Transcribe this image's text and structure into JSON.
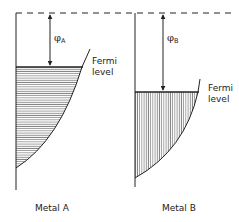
{
  "diagram": {
    "vacuum_level": {
      "style": "dashed"
    },
    "metals": [
      {
        "name": "Metal A",
        "work_function_symbol": "φ",
        "work_function_subscript": "A",
        "fermi_label_line1": "Fermi",
        "fermi_label_line2": "level",
        "fill_pattern": "horizontal-hatch"
      },
      {
        "name": "Metal B",
        "work_function_symbol": "φ",
        "work_function_subscript": "B",
        "fermi_label_line1": "Fermi",
        "fermi_label_line2": "level",
        "fill_pattern": "vertical-hatch"
      }
    ],
    "colors": {
      "line": "#222222",
      "hatch": "#555555",
      "background": "#ffffff"
    }
  }
}
